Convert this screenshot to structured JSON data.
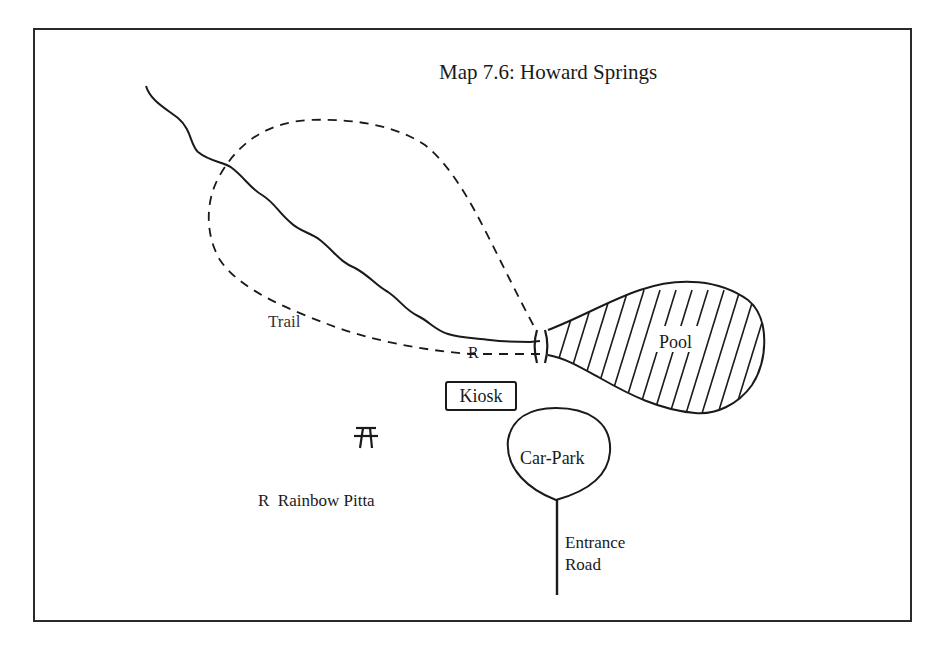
{
  "map": {
    "title": "Map 7.6:  Howard Springs",
    "labels": {
      "trail": "Trail",
      "bird_marker": "R",
      "kiosk": "Kiosk",
      "pool": "Pool",
      "car_park": "Car-Park",
      "entrance_road_line1": "Entrance",
      "entrance_road_line2": "Road"
    },
    "legend": {
      "marker": "R",
      "meaning": "Rainbow Pitta"
    },
    "icons": {
      "picnic_table": "picnic-table-symbol",
      "creek": "wavy-solid-line",
      "trail": "dashed-line",
      "bridge": "double-bar",
      "pool_fill": "diagonal-hatching"
    },
    "colors": {
      "ink": "#1a1a1a",
      "background": "#ffffff"
    }
  }
}
